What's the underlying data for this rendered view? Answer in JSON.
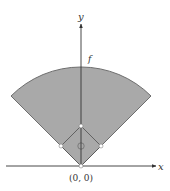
{
  "diagram": {
    "axes": {
      "x_label": "x",
      "y_label": "y",
      "origin_label": "(0, 0)"
    },
    "arc_label": "f",
    "colors": {
      "field_fill": "#a9a9a9",
      "field_edge": "#6e6e6e",
      "axis": "#333333",
      "base": "#ffffff",
      "text": "#333333"
    },
    "field": {
      "shape": "sector",
      "angle_start_deg": 45,
      "angle_end_deg": 135
    },
    "bases": [
      "home-plate",
      "first-base",
      "second-base",
      "third-base"
    ],
    "pitcher_mound": true
  }
}
